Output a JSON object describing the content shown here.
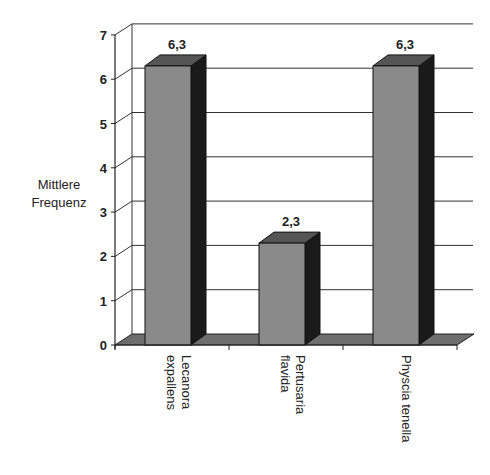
{
  "chart_data": {
    "type": "bar",
    "style": "3d-column",
    "title": "",
    "xlabel": "",
    "ylabel": "Mittlere Frequenz",
    "ylabel_lines": [
      "Mittlere",
      "Frequenz"
    ],
    "ylim": [
      0,
      7
    ],
    "yticks": [
      "0",
      "1",
      "2",
      "3",
      "4",
      "5",
      "6",
      "7"
    ],
    "grid": true,
    "legend": null,
    "categories": [
      "Lecanora expallens",
      "Pertusaria flavida",
      "Physcia tenella"
    ],
    "category_lines": [
      [
        "Lecanora",
        "expallens"
      ],
      [
        "Pertusaria",
        "flavida"
      ],
      [
        "Physcia tenella"
      ]
    ],
    "values": [
      6.3,
      2.3,
      6.3
    ],
    "data_labels": [
      "6,3",
      "2,3",
      "6,3"
    ],
    "colors": {
      "bar_front": "#8a8a8a",
      "bar_top": "#555555",
      "bar_side": "#1a1a1a",
      "floor": "#6e6e6e",
      "grid": "#333333"
    }
  }
}
